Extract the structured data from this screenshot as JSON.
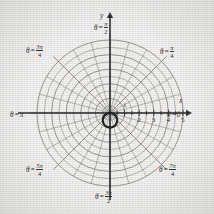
{
  "figure": {
    "kind": "polar-coordinate-grid",
    "background_color": "#f4f3f1",
    "ink_color": "#2b2b2b",
    "grid_color": "#6f6d6a",
    "curve_color": "#1a1a1a"
  },
  "axes": {
    "x_letter": "x",
    "y_letter": "y",
    "origin_px": {
      "x": 110,
      "y": 113
    },
    "unit_px": 14.6,
    "x_arrow_end_px": 186,
    "y_arrow_end_px": 18
  },
  "ticks": {
    "radial_labels": [
      "1",
      "2",
      "3",
      "4",
      "5"
    ],
    "radial_values": [
      1,
      2,
      3,
      4,
      5
    ],
    "label_one_above_axis": true
  },
  "angle_labels": [
    {
      "id": "theta-0",
      "theta_symbol": "θ",
      "equals": "=",
      "value_type": "plain",
      "whole": "0",
      "numerator": "",
      "denominator": "",
      "degrees": 0,
      "left": 167,
      "top": 112
    },
    {
      "id": "theta-pi-4",
      "theta_symbol": "θ",
      "equals": "=",
      "value_type": "fraction",
      "whole": "",
      "numerator": "π",
      "denominator": "4",
      "degrees": 45,
      "left": 160,
      "top": 45
    },
    {
      "id": "theta-pi-2",
      "theta_symbol": "θ",
      "equals": "=",
      "value_type": "fraction",
      "whole": "",
      "numerator": "π",
      "denominator": "2",
      "degrees": 90,
      "left": 94,
      "top": 21
    },
    {
      "id": "theta-3pi-4",
      "theta_symbol": "θ",
      "equals": "=",
      "value_type": "fraction",
      "whole": "",
      "numerator": "3π",
      "denominator": "4",
      "degrees": 135,
      "left": 26,
      "top": 44
    },
    {
      "id": "theta-pi",
      "theta_symbol": "θ",
      "equals": "=",
      "value_type": "plain",
      "whole": "π",
      "numerator": "",
      "denominator": "",
      "degrees": 180,
      "left": 10,
      "top": 112
    },
    {
      "id": "theta-5pi-4",
      "theta_symbol": "θ",
      "equals": "=",
      "value_type": "fraction",
      "whole": "",
      "numerator": "5π",
      "denominator": "4",
      "degrees": 225,
      "left": 26,
      "top": 163
    },
    {
      "id": "theta-3pi-2",
      "theta_symbol": "θ",
      "equals": "=",
      "value_type": "fraction",
      "whole": "",
      "numerator": "3π",
      "denominator": "2",
      "degrees": 270,
      "left": 95,
      "top": 190
    },
    {
      "id": "theta-7pi-4",
      "theta_symbol": "θ",
      "equals": "=",
      "value_type": "fraction",
      "whole": "",
      "numerator": "7π",
      "denominator": "4",
      "degrees": 315,
      "left": 159,
      "top": 163
    }
  ],
  "chart_data": {
    "type": "line",
    "title": "",
    "subtitle": "",
    "coordinate_system": "polar",
    "xlabel": "x",
    "ylabel": "y",
    "grid": true,
    "legend": null,
    "polar_grid": {
      "radial_rings": [
        0.5,
        1,
        1.5,
        2,
        2.5,
        3,
        3.5,
        4,
        4.5,
        5
      ],
      "ring_max": 5,
      "spoke_count": 24,
      "spoke_step_degrees": 15,
      "labeled_angles_degrees": [
        0,
        45,
        90,
        135,
        180,
        225,
        270,
        315
      ]
    },
    "series": [
      {
        "name": "r = -sin θ",
        "equation": "r = -sin(theta)",
        "description": "circle of diameter 1 tangent to the pole, centered below the polar axis",
        "stroke_width_px": 2.2,
        "center_polar": {
          "r": 0.5,
          "theta_degrees": 270
        },
        "radius_units": 0.5,
        "samples_theta_degrees": [
          0,
          15,
          30,
          45,
          60,
          75,
          90,
          105,
          120,
          135,
          150,
          165,
          180
        ],
        "samples_r": [
          0.0,
          0.259,
          0.5,
          0.707,
          0.866,
          0.966,
          1.0,
          0.966,
          0.866,
          0.707,
          0.5,
          0.259,
          0.0
        ]
      }
    ],
    "rlim": [
      0,
      5
    ],
    "theta_lim_degrees": [
      0,
      360
    ]
  }
}
